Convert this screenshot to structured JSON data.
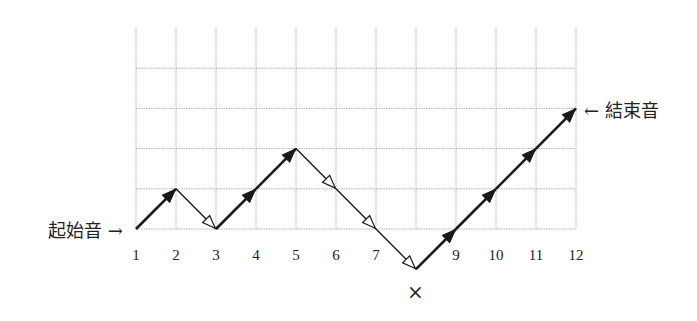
{
  "diagram": {
    "title": "",
    "start_label": "起始音 →",
    "end_label": "← 結束音",
    "cross_mark": "×",
    "x_ticks": [
      "1",
      "2",
      "3",
      "4",
      "5",
      "6",
      "7",
      "",
      "9",
      "10",
      "11",
      "12"
    ],
    "grid": {
      "columns": 12,
      "rows_above_baseline": 5
    },
    "path_levels": [
      0,
      1,
      0,
      1,
      2,
      1,
      0,
      -1,
      0,
      1,
      2,
      3
    ],
    "segment_styles": [
      "up-bold",
      "down-hollow",
      "up-bold",
      "up-bold",
      "down-hollow",
      "down-hollow",
      "down-hollow",
      "up-bold",
      "up-bold",
      "up-bold",
      "up-bold"
    ],
    "colors": {
      "grid": "#9a9a9a",
      "line": "#1a1a1a",
      "text": "#222222"
    }
  },
  "chart_data": {
    "type": "line",
    "x": [
      1,
      2,
      3,
      4,
      5,
      6,
      7,
      8,
      9,
      10,
      11,
      12
    ],
    "series": [
      {
        "name": "pitch path",
        "values": [
          0,
          1,
          0,
          1,
          2,
          1,
          0,
          -1,
          0,
          1,
          2,
          3
        ]
      }
    ],
    "annotations": [
      "起始音 → at x=1",
      "← 結束音 at x=12",
      "× below x=8"
    ],
    "xlabel": "",
    "ylabel": "",
    "grid": true
  }
}
